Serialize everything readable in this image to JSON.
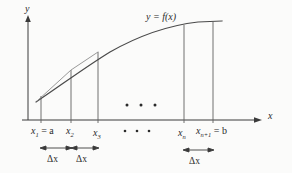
{
  "figure": {
    "type": "riemann-sum-partition-diagram",
    "background_color": "#fbfbfa",
    "ink_color": "#2b2b2b",
    "curve_color": "#555555",
    "axes": {
      "y_axis_label": "y",
      "x_axis_label": "x",
      "origin_px": [
        28,
        120
      ],
      "x_axis_end_px": [
        262,
        120
      ],
      "y_axis_top_px": [
        28,
        18
      ]
    },
    "curve_label": "y = f(x)",
    "curve_label_parts": {
      "y": "y",
      "equals": "=",
      "f": "f",
      "open": "(",
      "arg": "x",
      "close": ")"
    },
    "partition_points": [
      {
        "id": "x1",
        "var": "x",
        "sub": "1",
        "suffix": " = a",
        "x_px": 41,
        "top_px": 96,
        "label_x_px": 31,
        "label_y_px": 126
      },
      {
        "id": "x2",
        "var": "x",
        "sub": "2",
        "suffix": "",
        "x_px": 71,
        "top_px": 70,
        "label_x_px": 66,
        "label_y_px": 126
      },
      {
        "id": "x3",
        "var": "x",
        "sub": "3",
        "suffix": "",
        "x_px": 98,
        "top_px": 52,
        "label_x_px": 93,
        "label_y_px": 128
      },
      {
        "id": "xn",
        "var": "x",
        "sub": "n",
        "suffix": "",
        "x_px": 184,
        "top_px": 25,
        "label_x_px": 178,
        "label_y_px": 128
      },
      {
        "id": "xn1",
        "var": "x",
        "sub": "n+1",
        "suffix": " = b",
        "x_px": 213,
        "top_px": 22,
        "label_x_px": 196,
        "label_y_px": 126
      }
    ],
    "ellipsis_dots": {
      "glyph": "•",
      "plot_row": {
        "y_px": 105,
        "x_px": [
          127,
          141,
          155
        ]
      },
      "label_row": {
        "y_px": 131,
        "x_px": [
          125,
          137,
          149
        ]
      }
    },
    "delta_spans": [
      {
        "label": "Δx",
        "from_px": 41,
        "to_px": 71,
        "arrow_y_px": 148,
        "text_x_px": 47,
        "text_y_px": 154
      },
      {
        "label": "Δx",
        "from_px": 71,
        "to_px": 98,
        "arrow_y_px": 148,
        "text_x_px": 76,
        "text_y_px": 154
      },
      {
        "label": "Δx",
        "from_px": 184,
        "to_px": 213,
        "arrow_y_px": 150,
        "text_x_px": 189,
        "text_y_px": 156
      }
    ],
    "curve_path": "M 36 102 C 60 86, 84 68, 110 52 C 140 35, 172 25, 198 22 L 222 21",
    "curve_secant": "M 37 101 L 71 70 L 98 52"
  }
}
